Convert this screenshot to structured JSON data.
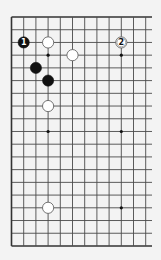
{
  "diagram": {
    "type": "go-board-partial",
    "columns": 12,
    "rows": 19,
    "edges": {
      "top": true,
      "left": true,
      "bottom": true,
      "right": false
    },
    "colors": {
      "background": "#f3f3f3",
      "line": "#4a4a4a",
      "edge": "#333333",
      "black_stone": "#111111",
      "white_stone": "#ffffff",
      "white_stroke": "#555555"
    },
    "star_points": [
      {
        "col": 3,
        "row": 3
      },
      {
        "col": 9,
        "row": 3
      },
      {
        "col": 3,
        "row": 9
      },
      {
        "col": 9,
        "row": 9
      },
      {
        "col": 9,
        "row": 15
      }
    ],
    "stones": [
      {
        "color": "black",
        "col": 1,
        "row": 2,
        "label": "1"
      },
      {
        "color": "white",
        "col": 3,
        "row": 2,
        "label": ""
      },
      {
        "color": "white",
        "col": 9,
        "row": 2,
        "label": "2"
      },
      {
        "color": "white",
        "col": 5,
        "row": 3,
        "label": ""
      },
      {
        "color": "black",
        "col": 2,
        "row": 4,
        "label": ""
      },
      {
        "color": "black",
        "col": 3,
        "row": 5,
        "label": ""
      },
      {
        "color": "white",
        "col": 3,
        "row": 7,
        "label": ""
      },
      {
        "color": "white",
        "col": 3,
        "row": 15,
        "label": ""
      }
    ]
  }
}
